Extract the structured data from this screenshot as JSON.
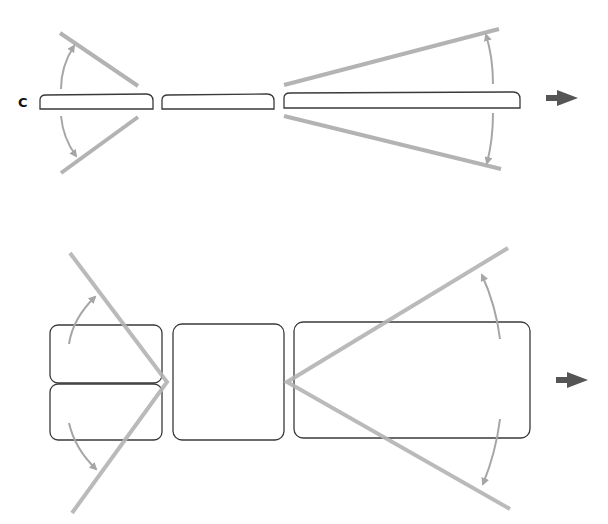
{
  "figure": {
    "panel_label": "C",
    "colors": {
      "outline": "#3a3a3a",
      "ray": "#b3b3b3",
      "angle_arrow": "#a6a6a6",
      "direction_arrow": "#555555",
      "background": "#ffffff"
    },
    "top_panel": {
      "description": "Three flat segments in a row; angles open at left and right ends",
      "segments": [
        {
          "name": "segment-1",
          "x": 40,
          "y": 94,
          "w": 113,
          "h": 15
        },
        {
          "name": "segment-2",
          "x": 162,
          "y": 94,
          "w": 112,
          "h": 15
        },
        {
          "name": "segment-3",
          "x": 284,
          "y": 92,
          "w": 236,
          "h": 16
        }
      ],
      "direction_arrow": "right-arrow-icon"
    },
    "bottom_panel": {
      "description": "Expanded blocks with two splayed angle rays from the left and right vertices",
      "blocks": [
        {
          "name": "block-top-left",
          "x": 50,
          "y": 325,
          "w": 112,
          "h": 58
        },
        {
          "name": "block-bottom-left",
          "x": 50,
          "y": 384,
          "w": 112,
          "h": 56
        },
        {
          "name": "block-middle",
          "x": 173,
          "y": 324,
          "w": 111,
          "h": 116
        },
        {
          "name": "block-right",
          "x": 294,
          "y": 322,
          "w": 236,
          "h": 116
        }
      ],
      "direction_arrow": "right-arrow-icon"
    }
  }
}
